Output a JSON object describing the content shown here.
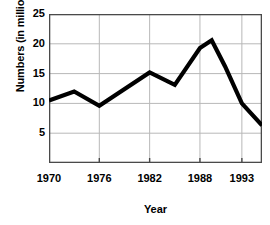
{
  "chart_data": {
    "type": "line",
    "title": "",
    "xlabel": "Year",
    "ylabel": "Numbers (in millions)",
    "xlim": [
      1970,
      1995.4
    ],
    "ylim": [
      0,
      25
    ],
    "xticks": [
      1970,
      1976,
      1982,
      1988,
      1993
    ],
    "xtick_labels": [
      "1970",
      "1976",
      "1982",
      "1988",
      "1993"
    ],
    "yticks": [
      5,
      10,
      15,
      20,
      25
    ],
    "ytick_labels": [
      "5",
      "10",
      "15",
      "20",
      "25"
    ],
    "grid": true,
    "legend": "none",
    "series": [
      {
        "name": "Numbers",
        "color": "#000000",
        "x": [
          1970.0,
          1973.0,
          1976.0,
          1982.0,
          1985.0,
          1988.0,
          1989.4,
          1991.0,
          1993.0,
          1995.4
        ],
        "values": [
          10.5,
          12.0,
          9.6,
          15.2,
          13.1,
          19.3,
          20.6,
          16.2,
          10.0,
          6.3
        ]
      }
    ]
  },
  "axes": {
    "ylabel_text": "Numbers (in millions)",
    "xlabel_text": "Year"
  },
  "style": {
    "line_color": "#000000",
    "grid_color": "#b8b8b8",
    "frame_color": "#4a4a4a",
    "background": "#ffffff"
  }
}
